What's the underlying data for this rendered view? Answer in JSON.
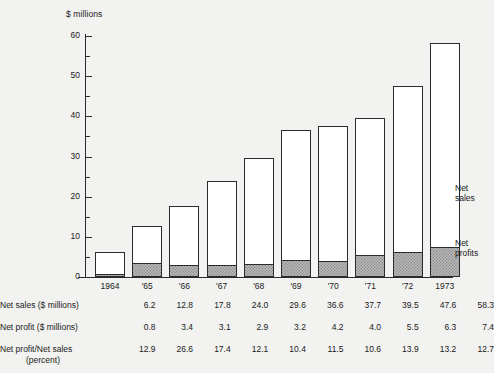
{
  "chart_data": {
    "type": "bar",
    "subtype": "stacked-bar",
    "title": "",
    "xlabel": "",
    "ylabel": "$ millions",
    "ylim": [
      0,
      60
    ],
    "ytick_step": 10,
    "yminor_step": 5,
    "grid": false,
    "legend_position": "right-inline-callout",
    "axis_title": "$ millions",
    "categories": [
      "1964",
      "'65",
      "'66",
      "'67",
      "'68",
      "'69",
      "'70",
      "'71",
      "'72",
      "1973"
    ],
    "ytick_labels": [
      "0",
      "10",
      "20",
      "30",
      "40",
      "50",
      "60"
    ],
    "series": [
      {
        "name": "Net sales",
        "values": [
          6.2,
          12.8,
          17.8,
          24.0,
          29.6,
          36.6,
          37.7,
          39.5,
          47.6,
          58.3
        ]
      },
      {
        "name": "Net profits",
        "values": [
          0.8,
          3.4,
          3.1,
          2.9,
          3.2,
          4.2,
          4.0,
          5.5,
          6.3,
          7.4
        ]
      }
    ],
    "annotations": [
      {
        "text": "Net\nsales",
        "refers_to": "Net sales"
      },
      {
        "text": "Net\nprofits",
        "refers_to": "Net profits"
      }
    ]
  },
  "callouts": {
    "net_sales_line1": "Net",
    "net_sales_line2": "sales",
    "net_profits_line1": "Net",
    "net_profits_line2": "profits"
  },
  "table": {
    "rows": [
      {
        "label": "Net sales ($ millions)",
        "label_line2": "",
        "values": [
          "6.2",
          "12.8",
          "17.8",
          "24.0",
          "29.6",
          "36.6",
          "37.7",
          "39.5",
          "47.6",
          "58.3"
        ]
      },
      {
        "label": "Net profit ($ millions)",
        "label_line2": "",
        "values": [
          "0.8",
          "3.4",
          "3.1",
          "2.9",
          "3.2",
          "4.2",
          "4.0",
          "5.5",
          "6.3",
          "7.4"
        ]
      },
      {
        "label": "Net profit/Net sales",
        "label_line2": "(percent)",
        "values": [
          "12.9",
          "26.6",
          "17.4",
          "12.1",
          "10.4",
          "11.5",
          "10.6",
          "13.9",
          "13.2",
          "12.7"
        ]
      }
    ]
  },
  "colors": {
    "background": "#f2f2f0",
    "ink": "#2b2b2b",
    "bar_fill": "#ffffff",
    "profit_fill": "#b9b9b9",
    "profit_hatch": "#8e8e8e"
  }
}
